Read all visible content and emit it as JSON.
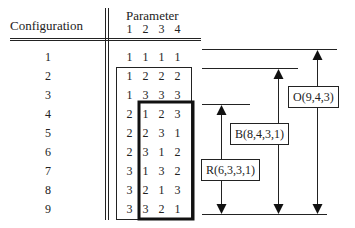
{
  "header": {
    "configuration_label": "Configuration",
    "parameter_label": "Parameter",
    "parameter_indices": [
      "1",
      "2",
      "3",
      "4"
    ]
  },
  "rows": [
    {
      "config": "1",
      "values": [
        "1",
        "1",
        "1",
        "1"
      ]
    },
    {
      "config": "2",
      "values": [
        "1",
        "2",
        "2",
        "2"
      ]
    },
    {
      "config": "3",
      "values": [
        "1",
        "3",
        "3",
        "3"
      ]
    },
    {
      "config": "4",
      "values": [
        "2",
        "1",
        "2",
        "3"
      ]
    },
    {
      "config": "5",
      "values": [
        "2",
        "2",
        "3",
        "1"
      ]
    },
    {
      "config": "6",
      "values": [
        "2",
        "3",
        "1",
        "2"
      ]
    },
    {
      "config": "7",
      "values": [
        "3",
        "1",
        "3",
        "2"
      ]
    },
    {
      "config": "8",
      "values": [
        "3",
        "2",
        "1",
        "3"
      ]
    },
    {
      "config": "9",
      "values": [
        "3",
        "3",
        "2",
        "1"
      ]
    }
  ],
  "annotations": {
    "O": "O(9,4,3)",
    "B": "B(8,4,3,1)",
    "R": "R(6,3,3,1)"
  }
}
